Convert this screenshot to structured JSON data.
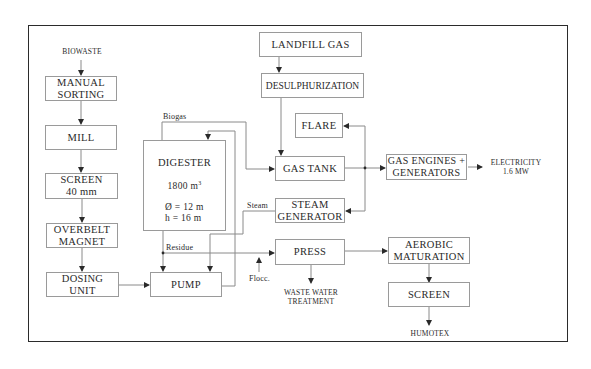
{
  "diagram": {
    "type": "process-flow",
    "title": "",
    "inputs": {
      "biowaste": "BIOWASTE",
      "landfill_gas": "LANDFILL  GAS"
    },
    "nodes": {
      "manual_sorting": {
        "line1": "MANUAL",
        "line2": "SORTING"
      },
      "mill": {
        "line1": "MILL"
      },
      "screen_40": {
        "line1": "SCREEN",
        "line2": "40 mm"
      },
      "overbelt_magnet": {
        "line1": "OVERBELT",
        "line2": "MAGNET"
      },
      "dosing_unit": {
        "line1": "DOSING",
        "line2": "UNIT"
      },
      "pump": {
        "line1": "PUMP"
      },
      "digester": {
        "title": "DIGESTER",
        "volume": "1800  m",
        "volume_sup": "3",
        "diameter": "Ø  =  12  m",
        "height": "h  =  16  m"
      },
      "desulphurization": {
        "line1": "DESULPHURIZATION"
      },
      "flare": {
        "line1": "FLARE"
      },
      "gas_tank": {
        "line1": "GAS  TANK"
      },
      "steam_generator": {
        "line1": "STEAM",
        "line2": "GENERATOR"
      },
      "press": {
        "line1": "PRESS"
      },
      "gas_engines": {
        "line1": "GAS  ENGINES  +",
        "line2": "GENERATORS"
      },
      "aerobic_maturation": {
        "line1": "AEROBIC",
        "line2": "MATURATION"
      },
      "screen_final": {
        "line1": "SCREEN"
      }
    },
    "flow_labels": {
      "biogas": "Biogas",
      "steam": "Steam",
      "residue": "Residue",
      "flocc": "Flocc."
    },
    "outputs": {
      "electricity": {
        "line1": "ELECTRICITY",
        "line2": "1.6  MW"
      },
      "waste_water": {
        "line1": "WASTE  WATER",
        "line2": "TREATMENT"
      },
      "humotex": "HUMOTEX"
    },
    "colors": {
      "frame": "#2b2b2b",
      "box_border": "#9a9a9a",
      "line": "#8a8a8a",
      "arrow": "#2a2a2a",
      "text": "#2a2a2a"
    }
  }
}
